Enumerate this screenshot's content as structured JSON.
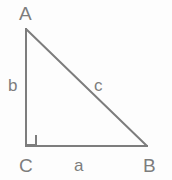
{
  "figure": {
    "name": "right-triangle-abc",
    "background_color": "#fdfdfd",
    "stroke_color": "#7d7d7d",
    "label_color": "#7d7d7d",
    "stroke_width": 2
  },
  "vertices": [
    {
      "id": "A",
      "label": "A",
      "x": 26,
      "y": 29
    },
    {
      "id": "B",
      "label": "B",
      "x": 147,
      "y": 146
    },
    {
      "id": "C",
      "label": "C",
      "x": 26,
      "y": 146
    }
  ],
  "sides": [
    {
      "id": "a",
      "label": "a",
      "from": "C",
      "to": "B",
      "position": "bottom"
    },
    {
      "id": "b",
      "label": "b",
      "from": "C",
      "to": "A",
      "position": "left"
    },
    {
      "id": "c",
      "label": "c",
      "from": "A",
      "to": "B",
      "position": "hypotenuse"
    }
  ],
  "markers": [
    {
      "id": "right-angle",
      "at_vertex": "C",
      "type": "square",
      "size": 10
    }
  ]
}
